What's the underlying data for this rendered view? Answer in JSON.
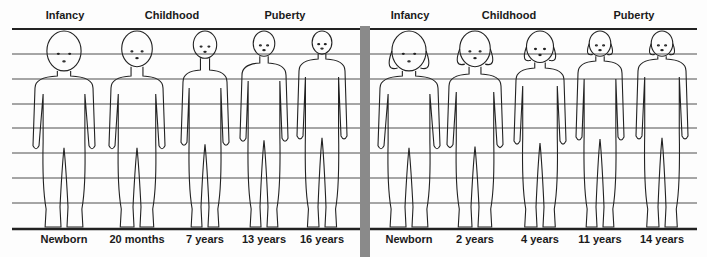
{
  "panels": [
    {
      "name": "male",
      "stages": [
        {
          "label": "Infancy",
          "x": 65
        },
        {
          "label": "Childhood",
          "x": 172
        },
        {
          "label": "Puberty",
          "x": 285
        }
      ],
      "figures": [
        {
          "age": "Newborn",
          "x": 64,
          "head_top": 31,
          "head_r": 19,
          "shoulder_y": 80,
          "width": 58
        },
        {
          "age": "20 months",
          "x": 137,
          "head_top": 31,
          "head_r": 17,
          "shoulder_y": 80,
          "width": 52
        },
        {
          "age": "7 years",
          "x": 205,
          "head_top": 31,
          "head_r": 13,
          "shoulder_y": 74,
          "width": 44
        },
        {
          "age": "13 years",
          "x": 264,
          "head_top": 31,
          "head_r": 12,
          "shoulder_y": 67,
          "width": 44
        },
        {
          "age": "16 years",
          "x": 322,
          "head_top": 31,
          "head_r": 11,
          "shoulder_y": 63,
          "width": 46
        }
      ]
    },
    {
      "name": "female",
      "stages": [
        {
          "label": "Infancy",
          "x": 410
        },
        {
          "label": "Childhood",
          "x": 509
        },
        {
          "label": "Puberty",
          "x": 634
        }
      ],
      "figures": [
        {
          "age": "Newborn",
          "x": 409,
          "head_top": 31,
          "head_r": 19,
          "shoulder_y": 80,
          "width": 58
        },
        {
          "age": "2 years",
          "x": 475,
          "head_top": 31,
          "head_r": 17,
          "shoulder_y": 78,
          "width": 52
        },
        {
          "age": "4 years",
          "x": 540,
          "head_top": 31,
          "head_r": 15,
          "shoulder_y": 72,
          "width": 48
        },
        {
          "age": "11 years",
          "x": 600,
          "head_top": 31,
          "head_r": 12,
          "shoulder_y": 65,
          "width": 44
        },
        {
          "age": "14 years",
          "x": 662,
          "head_top": 31,
          "head_r": 12,
          "shoulder_y": 63,
          "width": 48
        }
      ]
    }
  ],
  "grid": {
    "top_line_y": 29,
    "bottom_line_y": 229,
    "thin_lines_y": [
      54,
      79,
      104,
      128,
      153,
      178,
      203
    ],
    "line_color": "#222222",
    "divider_color": "#8a8a8a"
  }
}
